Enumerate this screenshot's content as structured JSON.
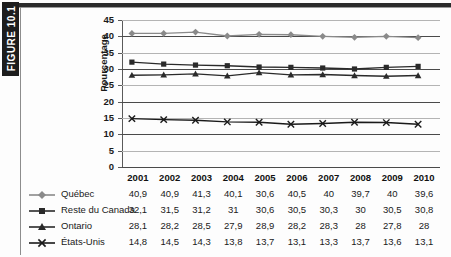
{
  "figure": {
    "tab_label": "FIGURE 10.1"
  },
  "chart_data": {
    "type": "line",
    "title": "",
    "xlabel": "",
    "ylabel": "Pourcentage",
    "ylim": [
      0,
      45
    ],
    "ytick_step": 5,
    "grid": true,
    "legend_position": "bottom-left-table",
    "categories": [
      "2001",
      "2002",
      "2003",
      "2004",
      "2005",
      "2006",
      "2007",
      "2008",
      "2009",
      "2010"
    ],
    "yticks": [
      "0",
      "5",
      "10",
      "15",
      "20",
      "25",
      "30",
      "35",
      "40",
      "45"
    ],
    "series": [
      {
        "name": "Québec",
        "marker": "diamond",
        "color": "#8a8a8a",
        "labels": [
          "40,9",
          "40,9",
          "41,3",
          "40,1",
          "30,6",
          "40,5",
          "40",
          "39,7",
          "40",
          "39,6"
        ],
        "values": [
          40.9,
          40.9,
          41.3,
          40.1,
          40.6,
          40.5,
          40.0,
          39.7,
          40.0,
          39.6
        ]
      },
      {
        "name": "Reste du Canada",
        "marker": "square",
        "color": "#2a2a2a",
        "labels": [
          "32,1",
          "31,5",
          "31,2",
          "31",
          "30,6",
          "30,5",
          "30,3",
          "30",
          "30,5",
          "30,8"
        ],
        "values": [
          32.1,
          31.5,
          31.2,
          31.0,
          30.6,
          30.5,
          30.3,
          30.0,
          30.5,
          30.8
        ]
      },
      {
        "name": "Ontario",
        "marker": "triangle",
        "color": "#2a2a2a",
        "labels": [
          "28,1",
          "28,2",
          "28,5",
          "27,9",
          "28,9",
          "28,2",
          "28,3",
          "28",
          "27,8",
          "28"
        ],
        "values": [
          28.1,
          28.2,
          28.5,
          27.9,
          28.9,
          28.2,
          28.3,
          28.0,
          27.8,
          28.0
        ]
      },
      {
        "name": "États-Unis",
        "marker": "cross",
        "color": "#1a1a1a",
        "labels": [
          "14,8",
          "14,5",
          "14,3",
          "13,8",
          "13,7",
          "13,1",
          "13,3",
          "13,7",
          "13,6",
          "13,1"
        ],
        "values": [
          14.8,
          14.5,
          14.3,
          13.8,
          13.7,
          13.1,
          13.3,
          13.7,
          13.6,
          13.1
        ]
      }
    ]
  }
}
